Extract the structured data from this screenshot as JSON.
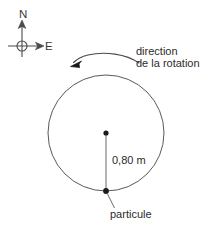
{
  "figure": {
    "stroke_color": "#4a4a4a",
    "text_color": "#2b2b2b",
    "background": "#ffffff"
  },
  "compass": {
    "name": "compass-rose",
    "north_label": "N",
    "east_label": "E",
    "center_x": 22,
    "center_y": 46,
    "ring_radius": 5
  },
  "rotation": {
    "label_line1": "direction",
    "label_line2": "de la rotation",
    "direction": "counterclockwise"
  },
  "circle": {
    "center_x": 106,
    "center_y": 133,
    "radius": 58
  },
  "radius_annotation": {
    "value": "0,80 m"
  },
  "particle": {
    "label": "particule",
    "x": 106,
    "y": 191
  }
}
